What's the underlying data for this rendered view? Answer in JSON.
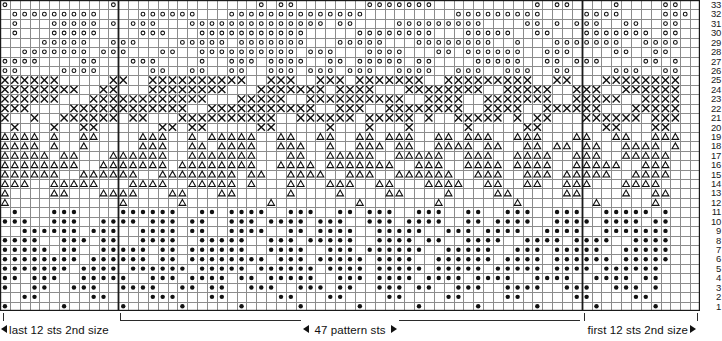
{
  "chart_data": {
    "type": "heatmap",
    "title": "",
    "xlabel": "",
    "ylabel": "",
    "columns": 71,
    "rows": 33,
    "row_numbers_side": "right",
    "row_number_labels": [
      "33",
      "32",
      "31",
      "30",
      "29",
      "28",
      "27",
      "26",
      "25",
      "24",
      "23",
      "22",
      "21",
      "20",
      "19",
      "18",
      "17",
      "16",
      "15",
      "14",
      "13",
      "12",
      "11",
      "10",
      "9",
      "8",
      "7",
      "6",
      "5",
      "4",
      "3",
      "2",
      "1"
    ],
    "symbol_legend": {
      "o": "open-circle",
      "x": "cross",
      "t": "triangle",
      "d": "filled-dot",
      ".": "empty"
    },
    "section_dividers_after_columns": [
      12,
      59
    ],
    "grid": [
      "o..........o..............o.oo.......ooooooo..........o.oo....o....oo",
      ".ooooooooo....oooooo...oooooooooooooo.........ooooooooo....oooo....ooo",
      ".o...ooooo.o.ooo...oooooooooooooo.oo....ooooooooo....oo.o.ooo..oo..oo",
      ".o...ooooo....ooo...ooooooooooo.....oooooooo...ooooo..oo...ooooooo.oo",
      "....ooooo..ooo....ooooo.ooooooo...ooooo...oooooooo..o...ooooooo..oooo",
      "..ooooooo.ooo...oo..oooooooooo.ooo...oooo...oo.oooooo..ooo....oo..oo",
      "oooo....oo...ooo....o..ooo.oooo..oo.ooooo.oo....ooooo..oo.ooo....oo.o",
      "oo....oooo.....oo..oo..oo..ooo.ooo.ooo..oooo..ooo..ooo..oo....ooo..oo",
      "xxxxxx.....xx..xxxxxxxxxx..xxx..xxx.xxxxxxx..xxxxxxxxx..xx...xxxxxxxx",
      "xxxxxxxx..xx...xxxxxxxx...xxxxxxx.xxxx...xxxxxxxx..xxxxx..xxx..xxxxxx",
      "xxxxxx...xxxxxxxxxxxx...xxxxx..xxxxxxxxxx..xxxx..xxxxxxx..xxxxx..xxxx",
      "xxx....xxxxxxxxxxxx..xxxxxxxxxxx..xxx..xxxxxxxx..xxxx..xxxxxx...xxxxx",
      "x..x..xxxxxx.xx...xxxxxxxxxx..xxxxxx.xxxxx.x..xxxxx.x.xx...xxxxxx.xxx",
      ".x...x..xx......xx.xx.....xx.....x...x...x.....x.....xx......xx...xx",
      "tttt.t..tt....ttt..t.ttttt..tt..tt..tt.ttt..tt.ttt..ttt...tt..tt..ttt",
      "tttt.t..t.....ttt..tt.tttt..ttt..t..ttt.tt..tttt.tt..tt.tt.tt..tttt.t",
      "ttttt.tt...tttttt..ttttttt...tt..ttttt..ttttt..ttt..tttt..ttt..ttttt",
      "tttttttt..ttttttt.tttttttt..tttt.ttttttt..ttt..tttt.tttt..ttttt..ttt",
      "tttttt..tttttt..tttttttt.tt..tttt..ttt..tttttt..ttt..ttt.ttttt..tttt",
      "ttt..ttttt...tttt..ttttt.t...tt..ttt..tt...tttt..tt..tt..ttt...tttt",
      "t....tt...tttt...tt...tt.....t....t....tt....t....tt.....tt....t..tt",
      "t...........t.....t........t........t.......t.......t.......t.....t",
      ".d...ddd....dddddd..dd.dddd..ddd..dd.ddd..ddd..dd..ddd..ddd..ddddd.d",
      "ddd..ddd..dddd.ddd.dd..ddd.dddd.ddd..ddd.dddd..dd.dddd..dddd.dddd.dd",
      "..dddddd.ddd..dddd.dd..dddd..dd.dddd..ddddd..ddd.dddd..dddd..ddddddd",
      "dddd..ddd.dd..dddd..ddddd..ddd.ddddd..dddd.dd..dddd..dddd.dddd..dddd",
      "ddddd.dd..ddddd.dd.dddddd..dddd..ddd.dddddd..ddddd..ddd.ddddd..ddddd",
      "dddddddd.dddddd.dd.dddddddd.ddd.ddddd.dddd..dddddd.dddd.dddddd.ddddd",
      "ddddddd.dddd.dddddd.ddddd.dddddd.dddd.ddddd.ddddd.ddddd.dddd.dddddd",
      "dd.ddd..ddddd..ddd.dddd.dd.ddddd..ddd.dddd.dddd.dddd..dddd..dddd.dd",
      "d..dd..ddd..dddd..dd.dd..ddd..ddd.dd..ddd.dd..ddd..dddd..ddd..ddd.d",
      "..dd.....dd....ddd...dd.....dd...dd....dd....dd....dd.....dd....dd",
      "d.....d.....d.....d.....d.....d.....d.....d.....d.....d.....d.....d"
    ]
  },
  "footer": {
    "left_label": "last 12 sts 2nd size",
    "center_label": "47 pattern sts",
    "right_label": "first 12 sts 2nd size"
  },
  "colors": {
    "grid_line": "#8c8c8c",
    "grid_line_heavy": "#1a1a1a",
    "symbol": "#111111",
    "background": "#ffffff",
    "text": "#111111"
  }
}
